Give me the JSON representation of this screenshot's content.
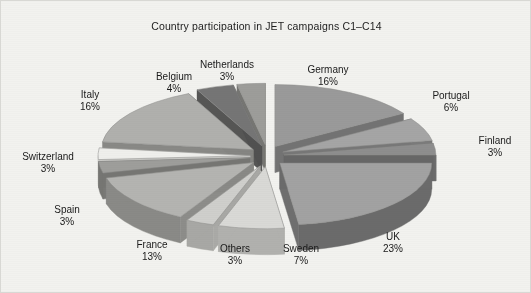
{
  "figure": {
    "title": "Country participation in JET campaigns C1–C14",
    "background_color": "#f2f2ef",
    "border_color": "#d8d8d4"
  },
  "chart_data": {
    "type": "pie",
    "title": "Country participation in JET campaigns C1–C14",
    "xlabel": "",
    "ylabel": "",
    "style": "3d-exploded",
    "value_unit": "%",
    "legend": "none (direct slice labels)",
    "grid": false,
    "categories": [
      "Germany",
      "Portugal",
      "Finland",
      "UK",
      "Sweden",
      "Others",
      "France",
      "Spain",
      "Switzerland",
      "Italy",
      "Belgium",
      "Netherlands"
    ],
    "values": [
      16,
      6,
      3,
      23,
      7,
      3,
      13,
      3,
      3,
      16,
      4,
      3
    ],
    "slices": [
      {
        "name": "Germany",
        "value": 16,
        "label": "Germany",
        "value_label": "16%",
        "top_color": "#9a9a9a",
        "side_color": "#6f6f6f",
        "label_x": 327,
        "label_y": 63
      },
      {
        "name": "Portugal",
        "value": 6,
        "label": "Portugal",
        "value_label": "6%",
        "top_color": "#a5a5a5",
        "side_color": "#787878",
        "label_x": 450,
        "label_y": 89
      },
      {
        "name": "Finland",
        "value": 3,
        "label": "Finland",
        "value_label": "3%",
        "top_color": "#8e8e8e",
        "side_color": "#676767",
        "label_x": 494,
        "label_y": 134
      },
      {
        "name": "UK",
        "value": 23,
        "label": "UK",
        "value_label": "23%",
        "top_color": "#a2a2a2",
        "side_color": "#6b6b6b",
        "label_x": 392,
        "label_y": 230
      },
      {
        "name": "Sweden",
        "value": 7,
        "label": "Sweden",
        "value_label": "7%",
        "label_x": 300,
        "label_y": 242,
        "top_color": "#d9d9d6",
        "side_color": "#b1b1ae"
      },
      {
        "name": "Others",
        "value": 3,
        "label": "Others",
        "value_label": "3%",
        "label_x": 234,
        "label_y": 242,
        "top_color": "#cfcfcc",
        "side_color": "#a8a8a5"
      },
      {
        "name": "France",
        "value": 13,
        "label": "France",
        "value_label": "13%",
        "label_x": 151,
        "label_y": 238,
        "top_color": "#b4b4b1",
        "side_color": "#8a8a87"
      },
      {
        "name": "Spain",
        "value": 3,
        "label": "Spain",
        "value_label": "3%",
        "label_x": 66,
        "label_y": 203,
        "top_color": "#9e9e9b",
        "side_color": "#767673"
      },
      {
        "name": "Switzerland",
        "value": 3,
        "label": "Switzerland",
        "value_label": "3%",
        "label_x": 47,
        "label_y": 150,
        "top_color": "#efefec",
        "side_color": "#c8c8c5"
      },
      {
        "name": "Italy",
        "value": 16,
        "label": "Italy",
        "value_label": "16%",
        "label_x": 89,
        "label_y": 88,
        "top_color": "#b0b0ad",
        "side_color": "#868683"
      },
      {
        "name": "Belgium",
        "value": 4,
        "label": "Belgium",
        "value_label": "4%",
        "label_x": 173,
        "label_y": 70,
        "top_color": "#757575",
        "side_color": "#515151"
      },
      {
        "name": "Netherlands",
        "value": 3,
        "label": "Netherlands",
        "value_label": "3%",
        "label_x": 226,
        "label_y": 58,
        "top_color": "#9d9d9a",
        "side_color": "#737370"
      }
    ]
  }
}
